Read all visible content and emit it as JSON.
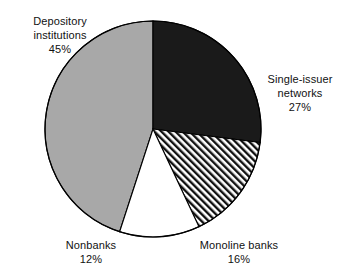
{
  "figure": {
    "background_color": "#ffffff",
    "outline_color": "#000000"
  },
  "chart_data": {
    "type": "pie",
    "title": "",
    "subtitle": "",
    "xlabel": "",
    "ylabel": "",
    "grid": false,
    "legend_position": "none",
    "label_format": "name + percent",
    "start_angle_deg": 0,
    "direction": "clockwise",
    "center_px": [
      153,
      129
    ],
    "radius_px": 108,
    "categories": [
      "Single-issuer networks",
      "Monoline banks",
      "Nonbanks",
      "Depository institutions"
    ],
    "values": [
      27,
      16,
      12,
      45
    ],
    "units": "percent",
    "total": 100,
    "slices": [
      {
        "name": "Single-issuer networks",
        "value": 27,
        "percent_label": "27%",
        "fill": "#1a1a1a",
        "pattern": "solid-black",
        "start_angle_deg": 0,
        "end_angle_deg": 97.2
      },
      {
        "name": "Monoline banks",
        "value": 16,
        "percent_label": "16%",
        "fill": "#ffffff",
        "pattern": "diagonal-hatch",
        "start_angle_deg": 97.2,
        "end_angle_deg": 154.8
      },
      {
        "name": "Nonbanks",
        "value": 12,
        "percent_label": "12%",
        "fill": "#ffffff",
        "pattern": "solid-white",
        "start_angle_deg": 154.8,
        "end_angle_deg": 198.0
      },
      {
        "name": "Depository institutions",
        "value": 45,
        "percent_label": "45%",
        "fill": "#a8a8a8",
        "pattern": "solid-gray",
        "start_angle_deg": 198.0,
        "end_angle_deg": 360.0
      }
    ]
  },
  "labels": {
    "depository": {
      "line1": "Depository",
      "line2": "institutions",
      "line3": "45%"
    },
    "single_issuer": {
      "line1": "Single-issuer",
      "line2": "networks",
      "line3": "27%"
    },
    "monoline": {
      "line1": "Monoline banks",
      "line2": "16%"
    },
    "nonbanks": {
      "line1": "Nonbanks",
      "line2": "12%"
    }
  }
}
